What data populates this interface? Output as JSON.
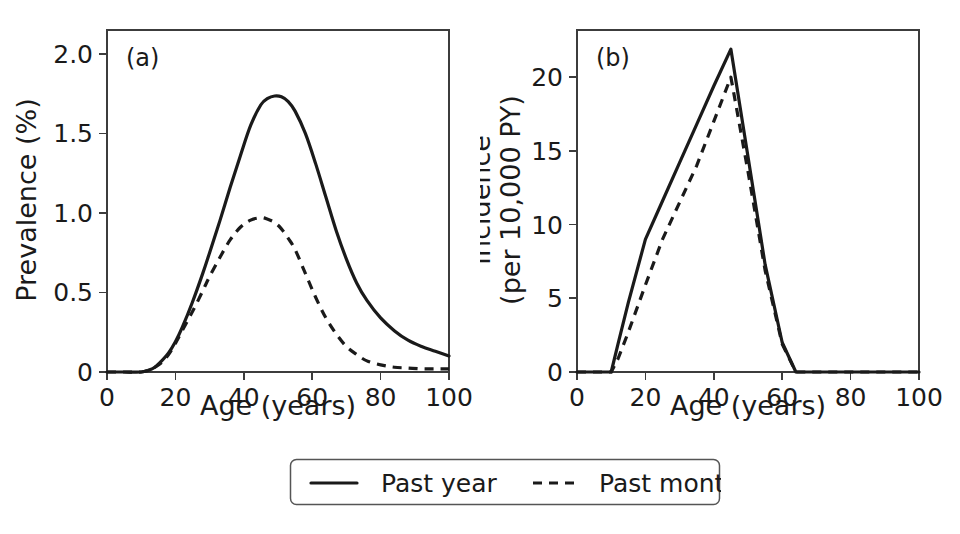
{
  "figure": {
    "background": "#ffffff",
    "line_color": "#1a1a1a",
    "axis_color": "#3c3c3c"
  },
  "legend": {
    "entries": [
      {
        "label": "Past year",
        "style": "solid"
      },
      {
        "label": "Past month",
        "style": "dashed"
      }
    ]
  },
  "chart_data": [
    {
      "type": "line",
      "panel_tag": "(a)",
      "title": "",
      "xlabel": "Age (years)",
      "ylabel": "Prevalence (%)",
      "xlim": [
        0,
        100
      ],
      "ylim": [
        0,
        2.15
      ],
      "xticks": [
        0,
        20,
        40,
        60,
        80,
        100
      ],
      "xticklabels": [
        "0",
        "20",
        "40",
        "60",
        "80",
        "100"
      ],
      "yticks": [
        0,
        0.5,
        1.0,
        1.5,
        2.0
      ],
      "yticklabels": [
        "0",
        "0.5",
        "1.0",
        "1.5",
        "2.0"
      ],
      "grid": false,
      "legend_position": "below-figure",
      "x": [
        0,
        5,
        10,
        12,
        14,
        16,
        18,
        20,
        22,
        25,
        28,
        30,
        33,
        36,
        39,
        42,
        45,
        47,
        49,
        51,
        53,
        55,
        58,
        61,
        64,
        67,
        70,
        73,
        76,
        80,
        84,
        88,
        92,
        96,
        100
      ],
      "series": [
        {
          "name": "Past year",
          "style": "solid",
          "values": [
            0.0,
            0.0,
            0.0,
            0.01,
            0.03,
            0.07,
            0.12,
            0.19,
            0.28,
            0.44,
            0.62,
            0.75,
            0.95,
            1.16,
            1.36,
            1.55,
            1.68,
            1.72,
            1.735,
            1.73,
            1.7,
            1.64,
            1.5,
            1.31,
            1.1,
            0.89,
            0.71,
            0.56,
            0.45,
            0.34,
            0.26,
            0.2,
            0.16,
            0.13,
            0.1
          ]
        },
        {
          "name": "Past month",
          "style": "dashed",
          "values": [
            0.0,
            0.0,
            0.0,
            0.01,
            0.03,
            0.06,
            0.11,
            0.18,
            0.26,
            0.38,
            0.51,
            0.6,
            0.72,
            0.83,
            0.91,
            0.955,
            0.97,
            0.96,
            0.94,
            0.9,
            0.84,
            0.77,
            0.62,
            0.47,
            0.34,
            0.24,
            0.16,
            0.11,
            0.07,
            0.045,
            0.03,
            0.025,
            0.02,
            0.02,
            0.02
          ]
        }
      ]
    },
    {
      "type": "line",
      "panel_tag": "(b)",
      "title": "",
      "xlabel": "Age (years)",
      "ylabel": "Incidence\n(per 10,000 PY)",
      "ylabel_line1": "Incidence",
      "ylabel_line2": "(per 10,000 PY)",
      "xlim": [
        0,
        100
      ],
      "ylim": [
        0,
        23.2
      ],
      "xticks": [
        0,
        20,
        40,
        60,
        80,
        100
      ],
      "xticklabels": [
        "0",
        "20",
        "40",
        "60",
        "80",
        "100"
      ],
      "yticks": [
        0,
        5,
        10,
        15,
        20
      ],
      "yticklabels": [
        "0",
        "5",
        "10",
        "15",
        "20"
      ],
      "grid": false,
      "legend_position": "below-figure",
      "x": [
        0,
        5,
        10,
        12,
        15,
        20,
        25,
        30,
        35,
        40,
        45,
        50,
        55,
        60,
        64,
        65,
        70,
        80,
        90,
        100
      ],
      "series": [
        {
          "name": "Past year",
          "style": "solid",
          "values": [
            0.0,
            0.0,
            0.0,
            1.9,
            4.7,
            9.0,
            11.6,
            14.2,
            16.8,
            19.4,
            21.9,
            14.6,
            7.3,
            2.0,
            0.0,
            0.0,
            0.0,
            0.0,
            0.0,
            0.0
          ]
        },
        {
          "name": "Past month",
          "style": "dashed",
          "values": [
            0.0,
            0.0,
            0.0,
            0.9,
            2.7,
            5.9,
            9.0,
            11.5,
            14.0,
            17.0,
            20.0,
            13.6,
            6.9,
            1.9,
            0.0,
            0.0,
            0.0,
            0.0,
            0.0,
            0.0
          ]
        }
      ]
    }
  ]
}
